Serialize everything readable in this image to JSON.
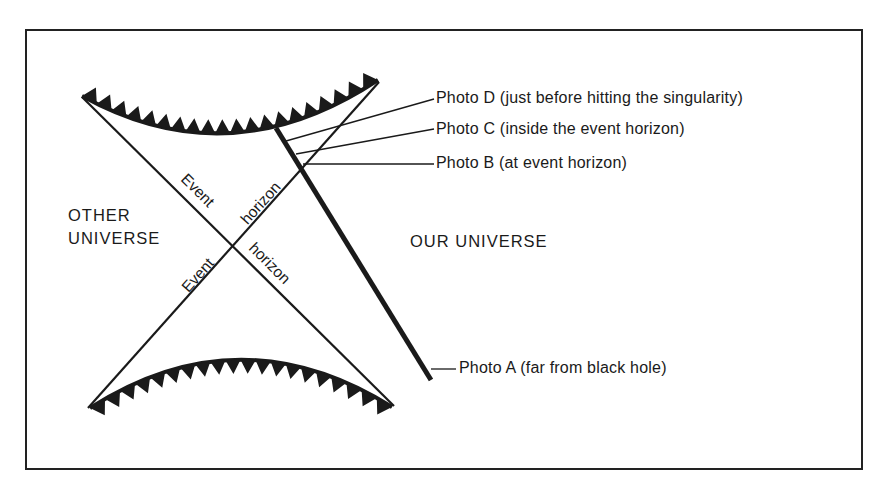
{
  "diagram": {
    "type": "Penrose spacetime diagram of a black hole",
    "regions": {
      "other_universe": [
        "OTHER",
        "UNIVERSE"
      ],
      "our_universe": "OUR UNIVERSE"
    },
    "horizon_labels": {
      "upper_left": "Event",
      "upper_right": "horizon",
      "lower_left": "Event",
      "lower_right": "horizon"
    },
    "photo_labels": [
      {
        "id": "D",
        "text": "Photo D (just before hitting the singularity)"
      },
      {
        "id": "C",
        "text": "Photo C (inside the event horizon)"
      },
      {
        "id": "B",
        "text": "Photo B (at event horizon)"
      },
      {
        "id": "A",
        "text": "Photo A (far from black hole)"
      }
    ],
    "elements": {
      "top_singularity": "jagged arc (future singularity)",
      "bottom_singularity": "jagged arc (past singularity)",
      "worldline": "thick line from Photo A up to top singularity"
    },
    "colors": {
      "ink": "#1a1a1a",
      "background": "#ffffff"
    }
  }
}
